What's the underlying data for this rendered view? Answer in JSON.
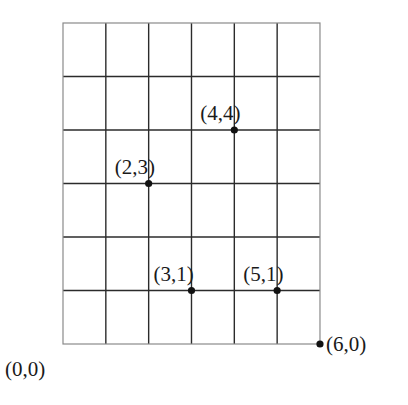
{
  "diagram": {
    "type": "coordinate-grid",
    "grid": {
      "columns": 6,
      "rows": 6,
      "origin_px": [
        63,
        344
      ],
      "cell_w_px": 42.83,
      "cell_h_px": 53.5,
      "line_color": "#2b2b2b",
      "border_color": "#8a8a8a"
    },
    "points": [
      {
        "x": 0,
        "y": 0,
        "label": "(0,0)",
        "dot": false,
        "label_dx": -58,
        "label_dy": 32
      },
      {
        "x": 6,
        "y": 0,
        "label": "(6,0)",
        "dot": true,
        "label_dx": 6,
        "label_dy": 7
      },
      {
        "x": 2,
        "y": 3,
        "label": "(2,3)",
        "dot": true,
        "label_dx": -34,
        "label_dy": -10
      },
      {
        "x": 4,
        "y": 4,
        "label": "(4,4)",
        "dot": true,
        "label_dx": -34,
        "label_dy": -10
      },
      {
        "x": 3,
        "y": 1,
        "label": "(3,1)",
        "dot": true,
        "label_dx": -38,
        "label_dy": -10
      },
      {
        "x": 5,
        "y": 1,
        "label": "(5,1)",
        "dot": true,
        "label_dx": -34,
        "label_dy": -10
      }
    ]
  }
}
